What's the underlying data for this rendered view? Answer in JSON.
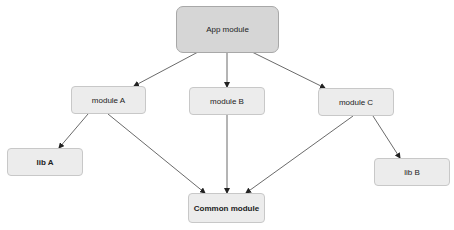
{
  "diagram": {
    "type": "dependency-graph",
    "nodes": [
      {
        "id": "app",
        "label": "App module"
      },
      {
        "id": "a",
        "label": "module A"
      },
      {
        "id": "b",
        "label": "module B"
      },
      {
        "id": "c",
        "label": "module C"
      },
      {
        "id": "liba",
        "label": "lib A"
      },
      {
        "id": "libb",
        "label": "lib B"
      },
      {
        "id": "common",
        "label": "Common module"
      }
    ],
    "edges": [
      {
        "from": "app",
        "to": "a"
      },
      {
        "from": "app",
        "to": "b"
      },
      {
        "from": "app",
        "to": "c"
      },
      {
        "from": "a",
        "to": "liba"
      },
      {
        "from": "a",
        "to": "common"
      },
      {
        "from": "b",
        "to": "common"
      },
      {
        "from": "c",
        "to": "common"
      },
      {
        "from": "c",
        "to": "libb"
      }
    ]
  }
}
